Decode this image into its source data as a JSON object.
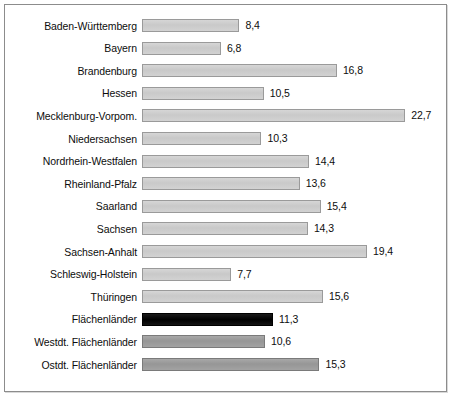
{
  "chart_data": {
    "type": "bar",
    "orientation": "horizontal",
    "title": "",
    "subtitle": "",
    "xlabel": "",
    "ylabel": "",
    "grid": false,
    "legend": "none",
    "xlim": [
      0,
      22.7
    ],
    "value_format": "german-decimal-comma",
    "categories": [
      "Baden-Württemberg",
      "Bayern",
      "Brandenburg",
      "Hessen",
      "Mecklenburg-Vorpom.",
      "Niedersachsen",
      "Nordrhein-Westfalen",
      "Rheinland-Pfalz",
      "Saarland",
      "Sachsen",
      "Sachsen-Anhalt",
      "Schleswig-Holstein",
      "Thüringen",
      "Flächenländer",
      "Westdt. Flächenländer",
      "Ostdt. Flächenländer"
    ],
    "values": [
      8.4,
      6.8,
      16.8,
      10.5,
      22.7,
      10.3,
      14.4,
      13.6,
      15.4,
      14.3,
      19.4,
      7.7,
      15.6,
      11.3,
      10.6,
      15.3
    ],
    "value_labels": [
      "8,4",
      "6,8",
      "16,8",
      "10,5",
      "22,7",
      "10,3",
      "14,4",
      "13,6",
      "15,4",
      "14,3",
      "19,4",
      "7,7",
      "15,6",
      "11,3",
      "10,6",
      "15,3"
    ],
    "bar_styles": [
      "light",
      "light",
      "light",
      "light",
      "light",
      "light",
      "light",
      "light",
      "light",
      "light",
      "light",
      "light",
      "light",
      "black",
      "dark",
      "dark"
    ]
  },
  "colors": {
    "bar_light": "#cccccc",
    "bar_dark": "#9c9c9c",
    "bar_black": "#0a0a0a",
    "bar_border": "#9a9a9a",
    "frame_border": "#8c8c8c",
    "text": "#0d0d0d",
    "background": "#ffffff"
  }
}
